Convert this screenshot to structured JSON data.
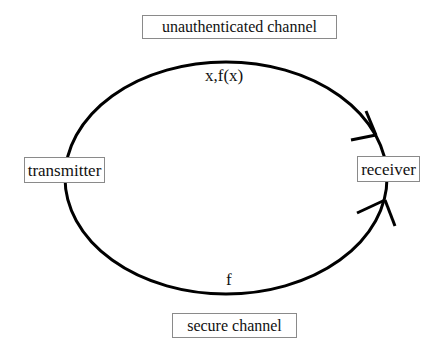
{
  "diagram": {
    "nodes": {
      "transmitter": "transmitter",
      "receiver": "receiver"
    },
    "channels": {
      "unauthenticated": {
        "label": "unauthenticated channel",
        "message": "x,f(x)"
      },
      "secure": {
        "label": "secure channel",
        "message": "f"
      }
    },
    "edges": [
      {
        "from": "transmitter",
        "to": "receiver",
        "via": "unauthenticated channel",
        "carries": "x,f(x)"
      },
      {
        "from": "transmitter",
        "to": "receiver",
        "via": "secure channel",
        "carries": "f"
      }
    ],
    "colors": {
      "stroke": "#000000",
      "box_border": "#8a8a8a",
      "background": "#ffffff"
    }
  }
}
